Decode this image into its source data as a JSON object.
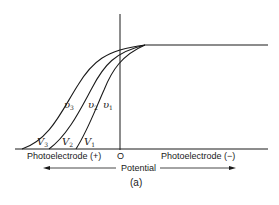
{
  "figure": {
    "caption": "(a)",
    "origin_label": "O",
    "left_axis_label": "Photoelectrode (+)",
    "right_axis_label": "Photoelectrode (−)",
    "axis_title": "Potential",
    "curves": [
      {
        "id": "1",
        "frequency_symbol": "υ",
        "frequency_sub": "1",
        "onset_symbol": "V",
        "onset_sub": "1"
      },
      {
        "id": "2",
        "frequency_symbol": "υ",
        "frequency_sub": "2",
        "onset_symbol": "V",
        "onset_sub": "2"
      },
      {
        "id": "3",
        "frequency_symbol": "υ",
        "frequency_sub": "3",
        "onset_symbol": "V",
        "onset_sub": "3"
      }
    ]
  },
  "colors": {
    "line": "#1a1a1a",
    "background": "#ffffff"
  }
}
